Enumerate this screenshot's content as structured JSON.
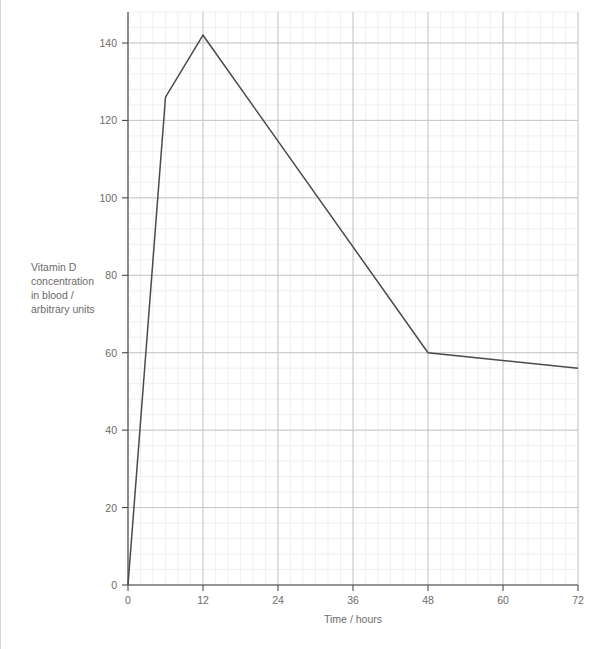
{
  "chart_data": {
    "type": "line",
    "title": "",
    "xlabel": "Time / hours",
    "ylabel": "Vitamin D concentration in blood / arbitrary units",
    "ylabel_lines": [
      "Vitamin D",
      "concentration",
      "in blood /",
      "arbitrary units"
    ],
    "x": [
      0,
      6,
      12,
      48,
      72
    ],
    "values": [
      0,
      126,
      142,
      60,
      56
    ],
    "series": [
      {
        "name": "Vitamin D concentration in blood",
        "points": [
          {
            "x": 0,
            "y": 0
          },
          {
            "x": 6,
            "y": 126
          },
          {
            "x": 12,
            "y": 142
          },
          {
            "x": 48,
            "y": 60
          },
          {
            "x": 72,
            "y": 56
          }
        ]
      }
    ],
    "xlim": [
      0,
      72
    ],
    "ylim": [
      0,
      148
    ],
    "xticks": [
      0,
      12,
      24,
      36,
      48,
      60,
      72
    ],
    "yticks": [
      0,
      20,
      40,
      60,
      80,
      100,
      120,
      140
    ],
    "xtick_labels": [
      "0",
      "12",
      "24",
      "36",
      "48",
      "60",
      "72"
    ],
    "ytick_labels": [
      "0",
      "20",
      "40",
      "60",
      "80",
      "100",
      "120",
      "140"
    ],
    "x_minor_step": 2,
    "y_minor_step": 4,
    "grid": true,
    "grid_minor": true,
    "legend": "none",
    "colors": {
      "line": "#4a4a4a",
      "axis": "#4a4a4a",
      "grid_major": "#c6c6ca",
      "grid_minor": "#e9e9ec",
      "text": "#6b6b6b",
      "background": "#ffffff"
    }
  },
  "axes": {
    "x_title": "Time / hours",
    "y_title_lines": [
      "Vitamin D",
      "concentration",
      "in blood /",
      "arbitrary units"
    ]
  }
}
